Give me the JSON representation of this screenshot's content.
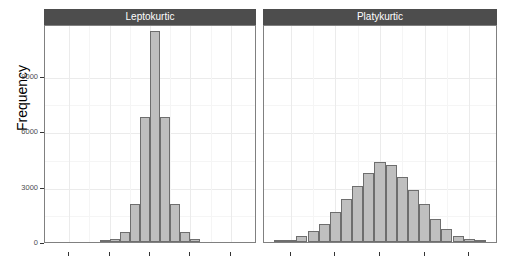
{
  "chart_data": {
    "type": "bar",
    "title": "",
    "subtitle": "",
    "xlabel": "",
    "ylabel": "Frequency",
    "ylim": [
      0,
      11800
    ],
    "yticks": [
      0,
      3000,
      6000,
      9000
    ],
    "ytick_labels": [
      "0",
      "3000",
      "6000",
      "9000"
    ],
    "grid": true,
    "grid_axis": "both",
    "legend": "none",
    "facet_labels": [
      "Leptokurtic",
      "Platykurtic"
    ],
    "panels": [
      {
        "label": "Leptokurtic",
        "xlim": [
          -5.2,
          5.2
        ],
        "xticks": [
          -4,
          -2,
          0,
          2,
          4
        ],
        "xtick_labels": [
          "",
          "",
          "",
          "",
          ""
        ],
        "bin_centers": [
          -2.25,
          -1.75,
          -1.25,
          -0.75,
          -0.25,
          0.25,
          0.75,
          1.25,
          1.75,
          2.25
        ],
        "values": [
          40,
          170,
          550,
          2050,
          6750,
          11400,
          6750,
          2050,
          550,
          170
        ],
        "bar_count": 10
      },
      {
        "label": "Platykurtic",
        "xlim": [
          -5.2,
          5.2
        ],
        "xticks": [
          -4,
          -2,
          0,
          2,
          4
        ],
        "xtick_labels": [
          "",
          "",
          "",
          "",
          ""
        ],
        "bin_centers": [
          -4.5,
          -4.0,
          -3.5,
          -3.0,
          -2.5,
          -2.0,
          -1.5,
          -1.0,
          -0.5,
          0.0,
          0.5,
          1.0,
          1.5,
          2.0,
          2.5,
          3.0,
          3.5,
          4.0,
          4.5
        ],
        "values": [
          60,
          120,
          300,
          600,
          1000,
          1600,
          2350,
          3050,
          3750,
          4350,
          4150,
          3500,
          2800,
          2050,
          1250,
          700,
          350,
          150,
          60
        ],
        "bar_count": 19
      }
    ]
  },
  "style": {
    "strip_background": "#4d4d4d",
    "strip_text_color": "#ffffff",
    "bar_fill": "#bfbfbf",
    "bar_outline": "#6e6e6e",
    "panel_background": "#ffffff",
    "panel_border": "#808080",
    "gridline_color": "#ebebeb",
    "axis_text_color": "#4d4d4d",
    "axis_title_color": "#000000"
  }
}
